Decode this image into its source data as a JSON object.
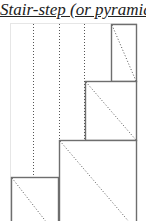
{
  "title": "Stair-step (or pyramid)",
  "colors": {
    "line": "#6e6e6e",
    "dotted": "#555555",
    "frame": "#e6e6e6",
    "background": "#ffffff"
  },
  "diagram": {
    "frame": {
      "x": 10,
      "y": 23,
      "w": 126,
      "h": 210
    },
    "dotted_verticals": [
      33,
      59,
      84
    ],
    "boxes": [
      {
        "name": "step-1",
        "x": 111,
        "y": 24,
        "w": 25,
        "h": 57
      },
      {
        "name": "step-2",
        "x": 85,
        "y": 81,
        "w": 51,
        "h": 59
      },
      {
        "name": "step-3",
        "x": 59,
        "y": 140,
        "w": 77,
        "h": 90
      },
      {
        "name": "step-4",
        "x": 11,
        "y": 177,
        "w": 47,
        "h": 60
      }
    ]
  }
}
